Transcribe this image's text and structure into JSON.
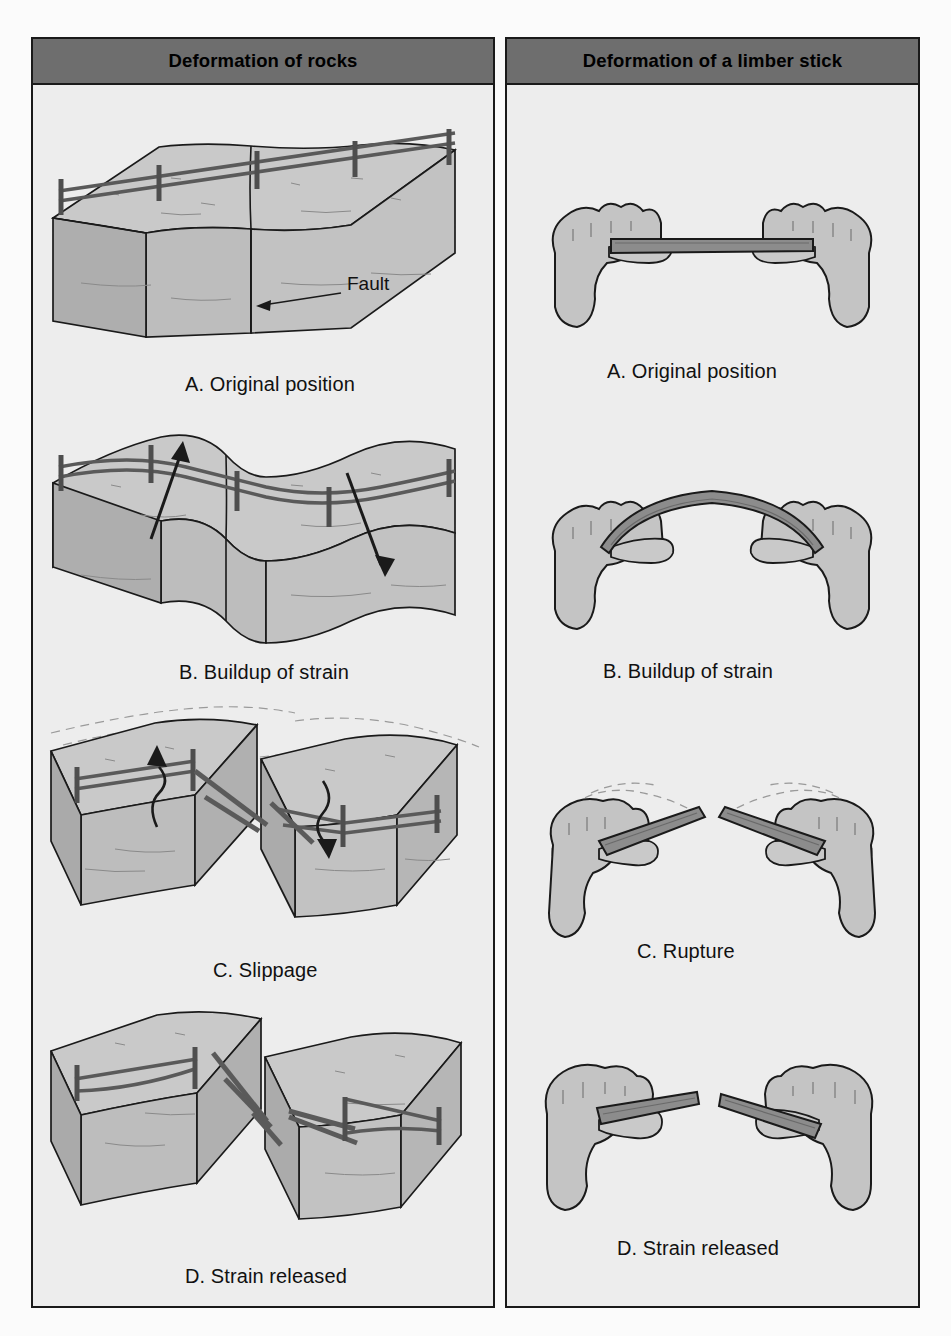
{
  "figure": {
    "title_left": "Deformation of rocks",
    "title_right": "Deformation of a limber stick",
    "background_color": "#ededed",
    "header_color": "#6e6e6e",
    "border_color": "#1a1a1a",
    "rock_top_color": "#c9c9c9",
    "rock_side_color": "#b4b4b4",
    "hand_color": "#c4c4c4",
    "stick_color": "#8c8c8c",
    "fence_color": "#5a5a5a"
  },
  "panels": {
    "rocks": {
      "title": "Deformation of rocks",
      "annotations": {
        "fault_label": "Fault"
      },
      "stages": [
        {
          "id": "rocks-a",
          "caption": "A. Original position"
        },
        {
          "id": "rocks-b",
          "caption": "B. Buildup of strain"
        },
        {
          "id": "rocks-c",
          "caption": "C. Slippage"
        },
        {
          "id": "rocks-d",
          "caption": "D. Strain released"
        }
      ]
    },
    "stick": {
      "title": "Deformation of a limber stick",
      "stages": [
        {
          "id": "stick-a",
          "caption": "A. Original position"
        },
        {
          "id": "stick-b",
          "caption": "B. Buildup of strain"
        },
        {
          "id": "stick-c",
          "caption": "C. Rupture"
        },
        {
          "id": "stick-d",
          "caption": "D. Strain released"
        }
      ]
    }
  }
}
